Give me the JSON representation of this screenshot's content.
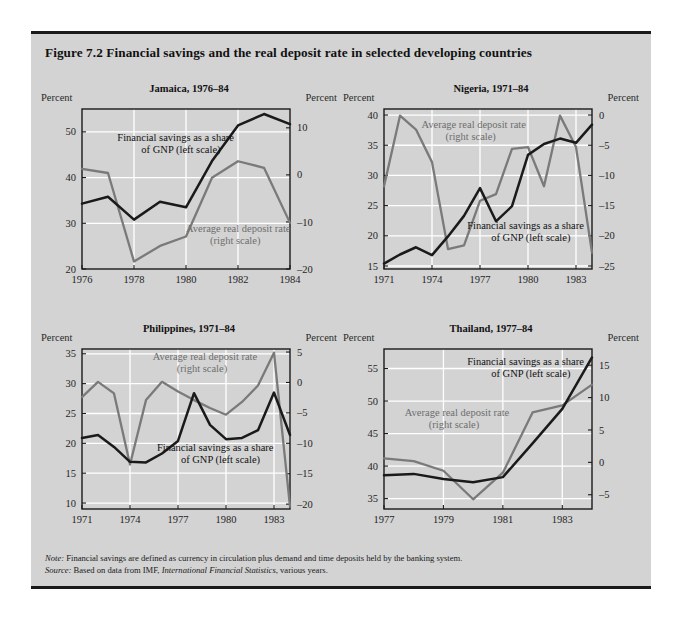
{
  "figure": {
    "title": "Figure 7.2  Financial savings and the real deposit rate in selected developing countries",
    "background_color": "#d3d3d3",
    "series_colors": {
      "financial_savings": "#1a1a1a",
      "real_deposit_rate": "#7a7a7a"
    }
  },
  "axis_unit_label_left": "Percent",
  "axis_unit_label_right": "Percent",
  "annotations": {
    "savings_line1": "Financial savings as a share",
    "savings_line2": "of GNP (left scale)",
    "deposit_line1": "Average real deposit rate",
    "deposit_line2": "(right scale)"
  },
  "footnotes": {
    "note_lead": "Note:",
    "note_text": " Financial savings are defined as currency in circulation plus demand and time deposits held by the banking system.",
    "source_lead": "Source:",
    "source_pre": " Based on data from IMF, ",
    "source_italic": "International Financial Statistics",
    "source_post": ", various years."
  },
  "chart_data": [
    {
      "id": "jamaica",
      "type": "line",
      "title": "Jamaica, 1976–84",
      "xlabel": "",
      "ylabel": "Percent",
      "ylabel_right": "Percent",
      "xlim": [
        1976,
        1984
      ],
      "ylim": [
        20,
        55
      ],
      "ylim_right": [
        -20,
        14
      ],
      "yticks": [
        20,
        30,
        40,
        50
      ],
      "yticks_right": [
        -20,
        -10,
        0,
        10
      ],
      "xticks": [
        1976,
        1978,
        1980,
        1982,
        1984
      ],
      "xticklabels": [
        "1976",
        "1978",
        "1980",
        "1982",
        "1984"
      ],
      "grid": true,
      "x": [
        1976,
        1977,
        1978,
        1979,
        1980,
        1981,
        1982,
        1983,
        1984
      ],
      "series": [
        {
          "name": "Financial savings as a share of GNP (left scale)",
          "axis": "left",
          "color": "#1a1a1a",
          "values": [
            34.3,
            35.8,
            30.8,
            34.7,
            33.5,
            43.6,
            51.4,
            53.9,
            51.7
          ]
        },
        {
          "name": "Average real deposit rate (right scale)",
          "axis": "right",
          "color": "#7a7a7a",
          "values": [
            1.3,
            0.4,
            -18.4,
            -15.1,
            -13.1,
            -0.6,
            2.9,
            1.5,
            -10.2
          ]
        }
      ]
    },
    {
      "id": "nigeria",
      "type": "line",
      "title": "Nigeria, 1971–84",
      "xlabel": "",
      "ylabel": "Percent",
      "ylabel_right": "Percent",
      "xlim": [
        1971,
        1984
      ],
      "ylim": [
        14.5,
        41
      ],
      "ylim_right": [
        -25.5,
        1
      ],
      "yticks": [
        15,
        20,
        25,
        30,
        35,
        40
      ],
      "yticks_right": [
        -25,
        -20,
        -15,
        -10,
        -5,
        0
      ],
      "xticks": [
        1971,
        1974,
        1977,
        1980,
        1983
      ],
      "xticklabels": [
        "1971",
        "1974",
        "1977",
        "1980",
        "1983"
      ],
      "grid": true,
      "x": [
        1971,
        1972,
        1973,
        1974,
        1975,
        1976,
        1977,
        1978,
        1979,
        1980,
        1981,
        1982,
        1983,
        1984
      ],
      "series": [
        {
          "name": "Financial savings as a share of GNP (left scale)",
          "axis": "left",
          "color": "#1a1a1a",
          "values": [
            15.4,
            16.9,
            18.1,
            16.8,
            19.9,
            23.3,
            27.9,
            22.4,
            24.9,
            33.4,
            35.2,
            36.1,
            35.4,
            38.4
          ]
        },
        {
          "name": "Average real deposit rate (right scale)",
          "axis": "right",
          "color": "#7a7a7a",
          "values": [
            -11.8,
            -0.1,
            -2.4,
            -7.8,
            -22.2,
            -21.6,
            -14.2,
            -13.1,
            -5.6,
            -5.3,
            -11.8,
            -0.1,
            -5.3,
            -22.8
          ]
        }
      ]
    },
    {
      "id": "philippines",
      "type": "line",
      "title": "Philippines, 1971–84",
      "xlabel": "",
      "ylabel": "Percent",
      "ylabel_right": "Percent",
      "xlim": [
        1971,
        1984
      ],
      "ylim": [
        9,
        35.8
      ],
      "ylim_right": [
        -20.8,
        5.5
      ],
      "yticks": [
        10,
        15,
        20,
        25,
        30,
        35
      ],
      "yticks_right": [
        -20,
        -15,
        -10,
        -5,
        0,
        5
      ],
      "xticks": [
        1971,
        1974,
        1977,
        1980,
        1983
      ],
      "xticklabels": [
        "1971",
        "1974",
        "1977",
        "1980",
        "1983"
      ],
      "grid": true,
      "x": [
        1971,
        1972,
        1973,
        1974,
        1975,
        1976,
        1977,
        1978,
        1979,
        1980,
        1981,
        1982,
        1983,
        1984
      ],
      "series": [
        {
          "name": "Financial savings as a share of GNP (left scale)",
          "axis": "left",
          "color": "#1a1a1a",
          "values": [
            20.9,
            21.4,
            19.4,
            16.9,
            16.8,
            18.3,
            20.4,
            28.4,
            23.1,
            20.7,
            20.9,
            22.2,
            28.5,
            21.4
          ]
        },
        {
          "name": "Average real deposit rate (right scale)",
          "axis": "right",
          "color": "#7a7a7a",
          "values": [
            -2.4,
            0.1,
            -1.8,
            -13.5,
            -2.9,
            0.1,
            -1.5,
            -2.9,
            -4.2,
            -5.3,
            -3.2,
            -0.5,
            4.9,
            -20.4
          ]
        }
      ]
    },
    {
      "id": "thailand",
      "type": "line",
      "title": "Thailand, 1977–84",
      "xlabel": "",
      "ylabel": "Percent",
      "ylabel_right": "Percent",
      "xlim": [
        1977,
        1984
      ],
      "ylim": [
        33.4,
        58
      ],
      "ylim_right": [
        -7.2,
        17.5
      ],
      "yticks": [
        35,
        40,
        45,
        50,
        55
      ],
      "yticks_right": [
        -5,
        0,
        5,
        10,
        15
      ],
      "xticks": [
        1977,
        1979,
        1981,
        1983
      ],
      "xticklabels": [
        "1977",
        "1979",
        "1981",
        "1983"
      ],
      "grid": true,
      "x": [
        1977,
        1978,
        1979,
        1980,
        1981,
        1982,
        1983,
        1984
      ],
      "series": [
        {
          "name": "Financial savings as a share of GNP (left scale)",
          "axis": "left",
          "color": "#1a1a1a",
          "values": [
            38.6,
            38.8,
            38.0,
            37.5,
            38.3,
            43.5,
            48.8,
            56.7
          ]
        },
        {
          "name": "Average real deposit rate (right scale)",
          "axis": "right",
          "color": "#7a7a7a",
          "values": [
            0.6,
            0.2,
            -1.3,
            -5.7,
            -1.6,
            7.7,
            8.8,
            12.0
          ]
        }
      ]
    }
  ],
  "annotation_positions": {
    "jamaica": {
      "savings": [
        0.17,
        0.2
      ],
      "deposit": [
        0.5,
        0.77
      ]
    },
    "nigeria": {
      "savings": [
        0.4,
        0.75
      ],
      "deposit": [
        0.18,
        0.12
      ]
    },
    "philippines": {
      "savings": [
        0.36,
        0.64
      ],
      "deposit": [
        0.34,
        0.07
      ]
    },
    "thailand": {
      "savings": [
        0.4,
        0.1
      ],
      "deposit": [
        0.1,
        0.42
      ]
    }
  }
}
